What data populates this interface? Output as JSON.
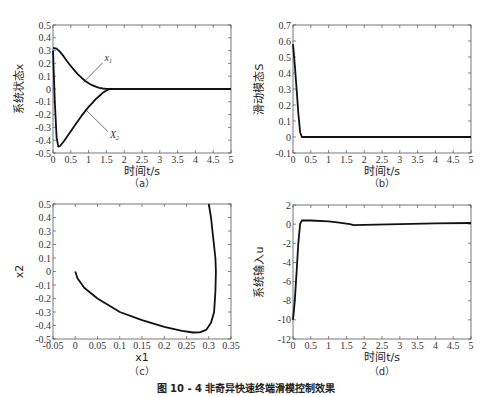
{
  "caption": "图 10 - 4 非奇异快速终端滑模控制效果",
  "chart_data": [
    {
      "id": "a",
      "type": "line",
      "sublabel": "（a）",
      "xlabel": "时间t/s",
      "ylabel": "系统状态x",
      "xlim": [
        0,
        5
      ],
      "ylim": [
        -0.5,
        0.5
      ],
      "xticks": [
        0,
        0.5,
        1,
        1.5,
        2,
        2.5,
        3,
        3.5,
        4,
        4.5,
        5
      ],
      "yticks": [
        -0.5,
        -0.4,
        -0.3,
        -0.2,
        -0.1,
        0,
        0.1,
        0.2,
        0.3,
        0.4,
        0.5
      ],
      "grid": false,
      "annotations": [
        {
          "text": "x1",
          "x": 1.45,
          "y": 0.22,
          "arrow_to": [
            0.85,
            0.05
          ]
        },
        {
          "text": "X2",
          "x": 1.6,
          "y": -0.38,
          "arrow_to": [
            0.95,
            -0.17
          ]
        }
      ],
      "series": [
        {
          "name": "x1",
          "x": [
            0,
            0.1,
            0.2,
            0.3,
            0.4,
            0.5,
            0.6,
            0.7,
            0.8,
            0.9,
            1.0,
            1.1,
            1.2,
            1.3,
            1.4,
            1.5,
            1.6,
            2,
            3,
            4,
            5
          ],
          "y": [
            0.32,
            0.315,
            0.29,
            0.255,
            0.215,
            0.18,
            0.145,
            0.115,
            0.088,
            0.065,
            0.045,
            0.03,
            0.018,
            0.009,
            0.004,
            0.001,
            0,
            0,
            0,
            0,
            0
          ]
        },
        {
          "name": "X2",
          "x": [
            0,
            0.05,
            0.1,
            0.15,
            0.2,
            0.3,
            0.4,
            0.5,
            0.6,
            0.7,
            0.8,
            0.9,
            1.0,
            1.1,
            1.2,
            1.3,
            1.4,
            1.5,
            1.6,
            2,
            3,
            4,
            5
          ],
          "y": [
            0.3,
            -0.1,
            -0.38,
            -0.45,
            -0.445,
            -0.41,
            -0.37,
            -0.33,
            -0.29,
            -0.25,
            -0.21,
            -0.175,
            -0.14,
            -0.11,
            -0.08,
            -0.055,
            -0.03,
            -0.012,
            0,
            0,
            0,
            0,
            0
          ]
        }
      ]
    },
    {
      "id": "b",
      "type": "line",
      "sublabel": "（b）",
      "xlabel": "时间t/s",
      "ylabel": "滑动模态S",
      "xlim": [
        0,
        5
      ],
      "ylim": [
        -0.1,
        0.7
      ],
      "xticks": [
        0,
        0.5,
        1,
        1.5,
        2,
        2.5,
        3,
        3.5,
        4,
        4.5,
        5
      ],
      "yticks": [
        -0.1,
        0,
        0.1,
        0.2,
        0.3,
        0.4,
        0.5,
        0.6,
        0.7
      ],
      "grid": false,
      "series": [
        {
          "name": "S",
          "x": [
            0,
            0.05,
            0.1,
            0.15,
            0.2,
            0.25,
            1,
            2,
            3,
            4,
            5
          ],
          "y": [
            0.58,
            0.45,
            0.3,
            0.15,
            0.03,
            0,
            0,
            0,
            0,
            0,
            0
          ]
        }
      ]
    },
    {
      "id": "c",
      "type": "line",
      "sublabel": "（c）",
      "xlabel": "x1",
      "ylabel": "x2",
      "xlim": [
        -0.05,
        0.35
      ],
      "ylim": [
        -0.5,
        0.5
      ],
      "xticks": [
        -0.05,
        0,
        0.05,
        0.1,
        0.15,
        0.2,
        0.25,
        0.3,
        0.35
      ],
      "yticks": [
        -0.5,
        -0.4,
        -0.3,
        -0.2,
        -0.1,
        0,
        0.1,
        0.2,
        0.3,
        0.4,
        0.5
      ],
      "grid": false,
      "series": [
        {
          "name": "phase",
          "x": [
            0.3,
            0.305,
            0.31,
            0.315,
            0.316,
            0.315,
            0.312,
            0.305,
            0.295,
            0.28,
            0.265,
            0.24,
            0.2,
            0.15,
            0.1,
            0.05,
            0.02,
            0.005,
            0
          ],
          "y": [
            0.5,
            0.4,
            0.25,
            0.1,
            0,
            -0.15,
            -0.3,
            -0.38,
            -0.43,
            -0.45,
            -0.452,
            -0.44,
            -0.41,
            -0.36,
            -0.3,
            -0.2,
            -0.12,
            -0.05,
            0
          ]
        }
      ]
    },
    {
      "id": "d",
      "type": "line",
      "sublabel": "（d）",
      "xlabel": "时间t/s",
      "ylabel": "系统输入u",
      "xlim": [
        0,
        5
      ],
      "ylim": [
        -12,
        2
      ],
      "xticks": [
        0,
        0.5,
        1,
        1.5,
        2,
        2.5,
        3,
        3.5,
        4,
        4.5,
        5
      ],
      "yticks": [
        -12,
        -10,
        -8,
        -6,
        -4,
        -2,
        0,
        2
      ],
      "grid": false,
      "series": [
        {
          "name": "u",
          "x": [
            0,
            0.05,
            0.1,
            0.15,
            0.2,
            0.25,
            0.5,
            1.0,
            1.3,
            1.6,
            1.7,
            2,
            3,
            4,
            5
          ],
          "y": [
            -10,
            -8,
            -5,
            -2,
            0,
            0.4,
            0.38,
            0.3,
            0.15,
            0,
            -0.1,
            -0.08,
            0,
            0.08,
            0.12
          ]
        }
      ]
    }
  ],
  "layout": {
    "frames": [
      {
        "left": 53,
        "top": 25,
        "right": 231,
        "bottom": 153
      },
      {
        "left": 293,
        "top": 25,
        "right": 471,
        "bottom": 153
      },
      {
        "left": 53,
        "top": 204,
        "right": 231,
        "bottom": 339
      },
      {
        "left": 293,
        "top": 205,
        "right": 471,
        "bottom": 339
      }
    ],
    "line_color": "#111111",
    "frame_color": "#555555"
  }
}
